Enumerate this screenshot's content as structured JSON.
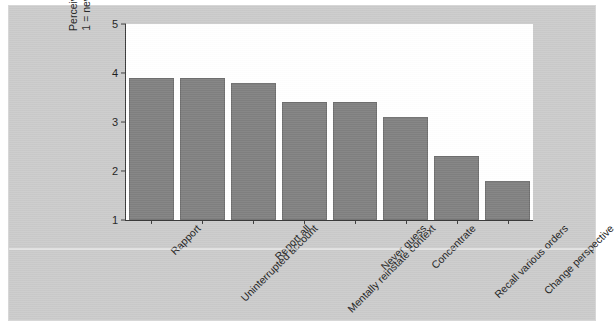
{
  "chart_data": {
    "type": "bar",
    "title": "",
    "xlabel": "",
    "ylabel": "Perceived usefulness",
    "ylabel_line2": "1 = never, 5 = always",
    "ylim": [
      1,
      5
    ],
    "yticks": [
      1,
      2,
      3,
      4,
      5
    ],
    "ytick_labels": [
      "1",
      "2",
      "3",
      "4",
      "5"
    ],
    "grid": false,
    "legend": false,
    "bar_color": "#808080",
    "plot_background": "#ffffff",
    "figure_background": "#c8c8c8",
    "categories": [
      "Rapport",
      "Uninterrupted account",
      "Report all",
      "Mentally reinstate context",
      "Never guess",
      "Concentrate",
      "Recall various orders",
      "Change perspective"
    ],
    "values": [
      3.9,
      3.9,
      3.8,
      3.4,
      3.4,
      3.1,
      2.3,
      1.8
    ]
  }
}
